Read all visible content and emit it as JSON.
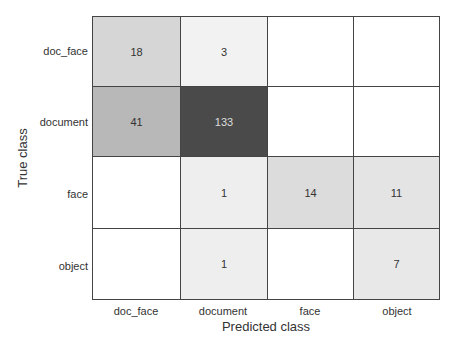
{
  "chart_data": {
    "type": "heatmap",
    "title": "",
    "xlabel": "Predicted class",
    "ylabel": "True class",
    "x_categories": [
      "doc_face",
      "document",
      "face",
      "object"
    ],
    "y_categories": [
      "doc_face",
      "document",
      "face",
      "object"
    ],
    "matrix": [
      [
        18,
        3,
        null,
        null
      ],
      [
        41,
        133,
        null,
        null
      ],
      [
        null,
        1,
        14,
        11
      ],
      [
        null,
        1,
        null,
        7
      ]
    ],
    "colors": [
      [
        "#d6d6d6",
        "#f2f2f2",
        "#ffffff",
        "#ffffff"
      ],
      [
        "#b8b8b8",
        "#4a4a4a",
        "#ffffff",
        "#ffffff"
      ],
      [
        "#ffffff",
        "#eeeeee",
        "#dcdcdc",
        "#e4e4e4"
      ],
      [
        "#ffffff",
        "#eeeeee",
        "#ffffff",
        "#e8e8e8"
      ]
    ],
    "text_colors": [
      [
        "#333333",
        "#333333",
        "#333333",
        "#333333"
      ],
      [
        "#333333",
        "#dddddd",
        "#333333",
        "#333333"
      ],
      [
        "#333333",
        "#333333",
        "#333333",
        "#333333"
      ],
      [
        "#333333",
        "#333333",
        "#333333",
        "#333333"
      ]
    ]
  },
  "labels": {
    "x0": "doc_face",
    "x1": "document",
    "x2": "face",
    "x3": "object",
    "y0": "doc_face",
    "y1": "document",
    "y2": "face",
    "y3": "object",
    "xtitle": "Predicted class",
    "ytitle": "True class"
  }
}
